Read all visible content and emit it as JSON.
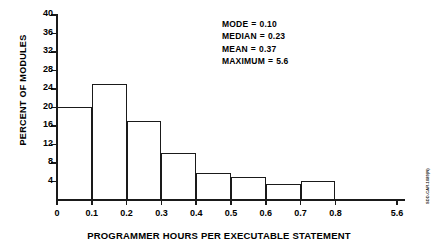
{
  "chart_data": {
    "type": "bar",
    "title": "",
    "subtitle": "",
    "xlabel": "PROGRAMMER HOURS PER EXECUTABLE STATEMENT",
    "ylabel": "PERCENT OF MODULES",
    "grid": false,
    "legend": "none",
    "style": "histogram-outline",
    "xlim": [
      0,
      0.9
    ],
    "ylim": [
      0,
      40
    ],
    "x_tick_labels": [
      "0",
      "0.1",
      "0.2",
      "0.3",
      "0.4",
      "0.5",
      "0.6",
      "0.7",
      "0.8",
      "5.6"
    ],
    "y_tick_labels": [
      "4",
      "8",
      "12",
      "16",
      "20",
      "24",
      "28",
      "32",
      "36",
      "40"
    ],
    "y_ticks": [
      4,
      8,
      12,
      16,
      20,
      24,
      28,
      32,
      36,
      40
    ],
    "axis_break_after": "0.8",
    "bin_width": 0.1,
    "bins": [
      {
        "range": "0-0.1",
        "x0": 0.0,
        "x1": 0.1,
        "value": 20.0
      },
      {
        "range": "0.1-0.2",
        "x0": 0.1,
        "x1": 0.2,
        "value": 24.8
      },
      {
        "range": "0.2-0.3",
        "x0": 0.2,
        "x1": 0.3,
        "value": 16.8
      },
      {
        "range": "0.3-0.4",
        "x0": 0.3,
        "x1": 0.4,
        "value": 10.0
      },
      {
        "range": "0.4-0.5",
        "x0": 0.4,
        "x1": 0.5,
        "value": 5.6
      },
      {
        "range": "0.5-0.6",
        "x0": 0.5,
        "x1": 0.6,
        "value": 4.8
      },
      {
        "range": "0.6-0.7",
        "x0": 0.6,
        "x1": 0.7,
        "value": 3.3
      },
      {
        "range": "0.7-0.8",
        "x0": 0.7,
        "x1": 0.8,
        "value": 4.0
      }
    ],
    "categories": [
      "0-0.1",
      "0.1-0.2",
      "0.2-0.3",
      "0.3-0.4",
      "0.4-0.5",
      "0.5-0.6",
      "0.6-0.7",
      "0.7-0.8"
    ],
    "values": [
      20.0,
      24.8,
      16.8,
      10.0,
      5.6,
      4.8,
      3.3,
      4.0
    ],
    "annotations": [
      {
        "label": "MODE",
        "eq": "=",
        "value": "0.10"
      },
      {
        "label": "MEDIAN",
        "eq": "=",
        "value": "0.23"
      },
      {
        "label": "MEAN",
        "eq": "=",
        "value": "0.37"
      },
      {
        "label": "MAXIMUM",
        "eq": "=",
        "value": "5.6"
      }
    ],
    "colors": {
      "line": "#1a1a1a",
      "background": "#ffffff",
      "text": "#000000"
    }
  },
  "figure_credit": "SDD-CAR-1089(N)"
}
